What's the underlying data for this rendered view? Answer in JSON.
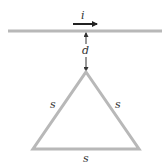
{
  "diagram": {
    "current_label": "i",
    "distance_label": "d",
    "side_labels": {
      "left": "s",
      "right": "s",
      "bottom": "s"
    },
    "colors": {
      "wire": "#b8b8b8",
      "triangle": "#b8b8b8",
      "arrow": "#222222",
      "text": "#333333"
    }
  }
}
